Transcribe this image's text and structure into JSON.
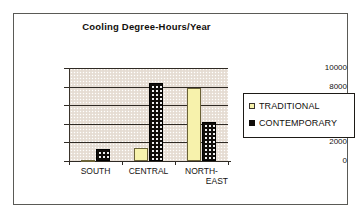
{
  "frame": {
    "border_color": "#5a5a56"
  },
  "chart_data": {
    "type": "bar",
    "title": "Cooling Degree-Hours/Year",
    "xlabel": "",
    "ylabel": "",
    "ylim": [
      0,
      10000
    ],
    "ytick_labels": [
      "10000",
      "8000",
      "6000",
      "4000",
      "2000",
      "0"
    ],
    "ytick_values": [
      10000,
      8000,
      6000,
      4000,
      2000,
      0
    ],
    "grid": true,
    "legend_position": "right",
    "categories": [
      "SOUTH",
      "CENTRAL",
      "NORTH-EAST"
    ],
    "category_lines": [
      [
        "SOUTH"
      ],
      [
        "CENTRAL"
      ],
      [
        "NORTH-",
        "EAST"
      ]
    ],
    "series": [
      {
        "name": "TRADITIONAL",
        "color": "#f7f2ac",
        "values": [
          150,
          1400,
          7900
        ]
      },
      {
        "name": "CONTEMPORARY",
        "color": "#100d0a",
        "values": [
          1300,
          8400,
          4150
        ]
      }
    ]
  },
  "legend": {
    "items": [
      {
        "label": "TRADITIONAL",
        "swatch": "legend-swatch-traditional"
      },
      {
        "label": "CONTEMPORARY",
        "swatch": "legend-swatch-contemporary"
      }
    ]
  }
}
